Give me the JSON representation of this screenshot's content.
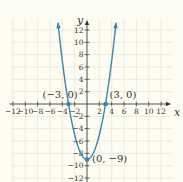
{
  "chart_data": {
    "type": "line",
    "title": "",
    "function": "y = x^2 - 9",
    "xlabel": "x",
    "ylabel": "y",
    "xlim": [
      -13,
      14
    ],
    "ylim": [
      -13,
      14
    ],
    "grid": true,
    "x_ticks": [
      -12,
      -10,
      -8,
      -6,
      -4,
      -2,
      2,
      4,
      6,
      8,
      10,
      12
    ],
    "y_ticks": [
      -12,
      -10,
      -8,
      -6,
      -4,
      -2,
      2,
      4,
      6,
      8,
      10,
      12
    ],
    "x_tick_labels": [
      "−12",
      "−10",
      "−8",
      "−6",
      "−4",
      "−2",
      "2",
      "4",
      "6",
      "8",
      "10",
      "12"
    ],
    "y_tick_labels": [
      "−12",
      "−10",
      "−8",
      "−6",
      "−4",
      "−2",
      "2",
      "4",
      "6",
      "8",
      "10",
      "12"
    ],
    "series": [
      {
        "name": "parabola",
        "x": [
          -4.7,
          -4,
          -3,
          -2,
          -1,
          0,
          1,
          2,
          3,
          4,
          4.7
        ],
        "y": [
          13.09,
          7,
          0,
          -5,
          -8,
          -9,
          -8,
          -5,
          0,
          7,
          13.09
        ]
      }
    ],
    "annotations": [
      {
        "label": "(−3, 0)",
        "x": -3,
        "y": 0
      },
      {
        "label": "(3, 0)",
        "x": 3,
        "y": 0
      },
      {
        "label": "(0, −9)",
        "x": 0,
        "y": -9
      }
    ],
    "colors": {
      "curve": "#3a86a8",
      "grid": "#e7e4cf",
      "axis": "#333333",
      "background": "#fefdf3"
    }
  }
}
